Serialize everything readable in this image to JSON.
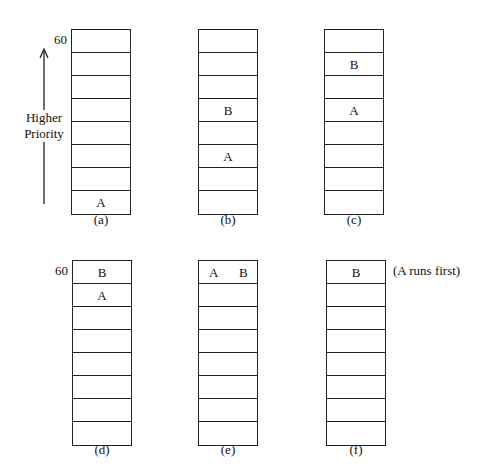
{
  "axis": {
    "top_value": "60",
    "label_line1": "Higher",
    "label_line2": "Priority"
  },
  "note": "(A runs first)",
  "panels": [
    {
      "id": "a",
      "caption": "(a)",
      "show_60": false,
      "slots": [
        [],
        [],
        [],
        [],
        [],
        [],
        [],
        [
          "A"
        ]
      ]
    },
    {
      "id": "b",
      "caption": "(b)",
      "show_60": false,
      "slots": [
        [],
        [],
        [],
        [
          "B"
        ],
        [],
        [
          "A"
        ],
        [],
        []
      ]
    },
    {
      "id": "c",
      "caption": "(c)",
      "show_60": false,
      "slots": [
        [],
        [
          "B"
        ],
        [],
        [
          "A"
        ],
        [],
        [],
        [],
        []
      ]
    },
    {
      "id": "d",
      "caption": "(d)",
      "show_60": true,
      "slots": [
        [
          "B"
        ],
        [
          "A"
        ],
        [],
        [],
        [],
        [],
        [],
        []
      ]
    },
    {
      "id": "e",
      "caption": "(e)",
      "show_60": false,
      "slots": [
        [
          "A",
          "B"
        ],
        [],
        [],
        [],
        [],
        [],
        [],
        []
      ]
    },
    {
      "id": "f",
      "caption": "(f)",
      "show_60": false,
      "slots": [
        [
          "B"
        ],
        [],
        [],
        [],
        [],
        [],
        [],
        []
      ]
    }
  ]
}
